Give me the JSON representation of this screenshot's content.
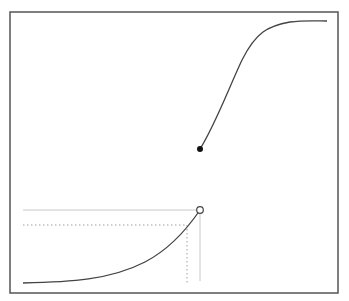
{
  "diagram": {
    "type": "piecewise-function-jump-discontinuity",
    "colors": {
      "frame": "#555555",
      "curve": "#444444",
      "guide_solid": "#c8c8c8",
      "guide_dotted": "#a0a0a0",
      "closed_point": "#111111",
      "open_point_fill": "#ffffff",
      "open_point_stroke": "#444444"
    },
    "frame": {
      "x": 10,
      "y": 12,
      "width": 328,
      "height": 281
    },
    "lower_branch": {
      "path": "M 23 283 C 70 282, 110 280, 145 262 C 168 250, 185 232, 200 210",
      "endpoint": {
        "x": 200,
        "y": 210,
        "kind": "open"
      }
    },
    "upper_branch": {
      "path": "M 200 149 C 215 125, 228 90, 242 60 C 256 32, 268 26, 290 22 C 305 20, 318 21, 327 21",
      "endpoint": {
        "x": 200,
        "y": 149,
        "kind": "closed"
      }
    },
    "guides": {
      "solid_horizontal": {
        "x1": 23,
        "y1": 210,
        "x2": 200,
        "y2": 210
      },
      "solid_vertical": {
        "x1": 200,
        "y1": 210,
        "x2": 200,
        "y2": 281
      },
      "dotted_horizontal": {
        "x1": 23,
        "y1": 225,
        "x2": 187,
        "y2": 225
      },
      "dotted_vertical": {
        "x1": 187,
        "y1": 225,
        "x2": 187,
        "y2": 284
      }
    }
  }
}
